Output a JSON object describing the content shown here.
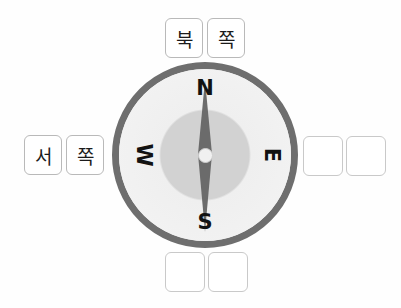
{
  "exercise": {
    "type": "drag-and-drop-labeling",
    "subject": "compass-directions-korean"
  },
  "compass": {
    "cardinals": {
      "north": "N",
      "south": "S",
      "west": "W",
      "east": "E"
    },
    "colors": {
      "rim": "#6e6e6e",
      "face": "#f3f3f3",
      "inner_disc": "#d2d2d2",
      "needle": "#6b6b6b",
      "hub": "#f0f0f0",
      "letter": "#121212"
    }
  },
  "groups": {
    "top": {
      "position": "north",
      "tiles": [
        {
          "label": "북",
          "filled": true
        },
        {
          "label": "쪽",
          "filled": true
        }
      ]
    },
    "left": {
      "position": "west",
      "tiles": [
        {
          "label": "서",
          "filled": true
        },
        {
          "label": "쪽",
          "filled": true
        }
      ]
    },
    "right": {
      "position": "east",
      "tiles": [
        {
          "label": "",
          "filled": false
        },
        {
          "label": "",
          "filled": false
        }
      ]
    },
    "bottom": {
      "position": "south",
      "tiles": [
        {
          "label": "",
          "filled": false
        },
        {
          "label": "",
          "filled": false
        }
      ]
    }
  }
}
